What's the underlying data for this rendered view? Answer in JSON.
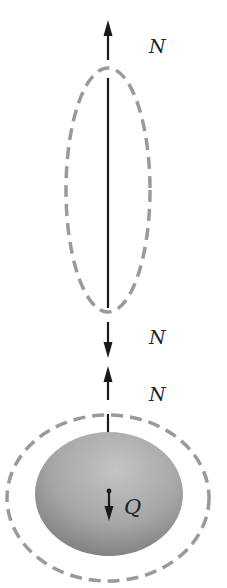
{
  "diagram": {
    "title": "",
    "labels": {
      "top_force": "N",
      "middle_force_down": "N",
      "middle_force_up": "N",
      "weight": "Q"
    },
    "colors": {
      "line": "#1a1a1a",
      "dashed_outline": "#9a9a9a",
      "body_fill_light": "#bdbdbd",
      "body_fill_dark": "#7a7a7a",
      "background": "#ffffff"
    },
    "elements": [
      {
        "id": "rope-free-body",
        "type": "dashed-ellipse",
        "description": "Dashed outline enclosing the rope segment"
      },
      {
        "id": "rope",
        "type": "line",
        "description": "Vertical rope"
      },
      {
        "id": "top-tension-arrow",
        "type": "arrow",
        "direction": "up",
        "label": "N"
      },
      {
        "id": "rope-bottom-tension-arrow",
        "type": "arrow",
        "direction": "down",
        "label": "N"
      },
      {
        "id": "body-tension-arrow",
        "type": "arrow",
        "direction": "up",
        "label": "N"
      },
      {
        "id": "body-free-body",
        "type": "dashed-ellipse",
        "description": "Dashed outline enclosing the hanging body"
      },
      {
        "id": "body",
        "type": "filled-ellipse",
        "description": "Hanging body"
      },
      {
        "id": "weight-arrow",
        "type": "arrow",
        "direction": "down",
        "label": "Q"
      }
    ]
  }
}
